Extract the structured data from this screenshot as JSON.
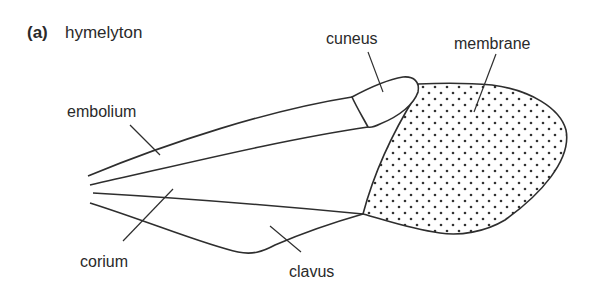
{
  "figure": {
    "panel_tag": "(a)",
    "title": "hymelyton",
    "colors": {
      "stroke": "#2e2e2e",
      "text": "#2a2a2a",
      "dots": "#333333",
      "background": "#ffffff"
    },
    "labels": {
      "embolium": "embolium",
      "cuneus": "cuneus",
      "membrane": "membrane",
      "corium": "corium",
      "clavus": "clavus"
    }
  }
}
